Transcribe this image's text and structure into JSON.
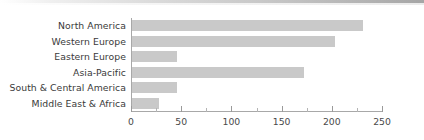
{
  "chart_data": {
    "type": "bar",
    "orientation": "horizontal",
    "title": "",
    "xlabel": "",
    "ylabel": "",
    "categories": [
      "North America",
      "Western Europe",
      "Eastern Europe",
      "Asia-Pacific",
      "South & Central America",
      "Middle East & Africa"
    ],
    "values": [
      230,
      202,
      45,
      171,
      45,
      27
    ],
    "xlim": [
      0,
      250
    ],
    "xticks": [
      0,
      50,
      100,
      150,
      200,
      250
    ],
    "xtick_labels": [
      "0",
      "50",
      "100",
      "150",
      "200",
      "250"
    ],
    "minor_tick_interval": 25,
    "grid": false,
    "legend": false,
    "bar_color": "#c9c9c9",
    "axis_color": "#a8a8a8",
    "text_color": "#3a3a3a"
  }
}
